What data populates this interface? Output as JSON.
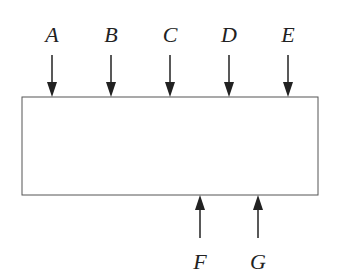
{
  "diagram": {
    "box": {
      "x": 22,
      "y": 97,
      "width": 296,
      "height": 98,
      "stroke": "#555555"
    },
    "top_forces": [
      {
        "label": "A",
        "x": 52
      },
      {
        "label": "B",
        "x": 111
      },
      {
        "label": "C",
        "x": 170
      },
      {
        "label": "D",
        "x": 229
      },
      {
        "label": "E",
        "x": 288
      }
    ],
    "bottom_forces": [
      {
        "label": "F",
        "x": 200
      },
      {
        "label": "G",
        "x": 258
      }
    ],
    "arrow_color": "#222222"
  }
}
